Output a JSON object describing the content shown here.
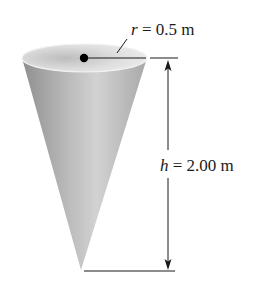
{
  "figure": {
    "radius_label": {
      "symbol": "r",
      "equals": " = ",
      "value": "0.5 m"
    },
    "height_label": {
      "symbol": "h",
      "equals": " = ",
      "value": "2.00 m"
    }
  },
  "colors": {
    "background": "#ffffff",
    "cone_light": "#e6e6e6",
    "cone_mid": "#bdbdbd",
    "cone_dark": "#8c8c8c",
    "line": "#1a1a1a"
  }
}
